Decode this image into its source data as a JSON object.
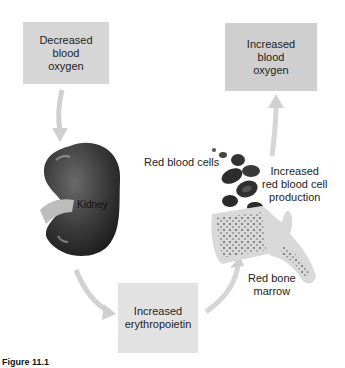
{
  "diagram": {
    "nodes": {
      "decreased_oxygen": "Decreased\nblood\noxygen",
      "increased_oxygen": "Increased\nblood\noxygen",
      "erythropoietin": "Increased\nerythropoietin"
    },
    "labels": {
      "kidney": "Kidney",
      "red_blood_cells": "Red blood cells",
      "rbc_production": "Increased\nred blood cell\nproduction",
      "red_bone_marrow": "Red bone\nmarrow"
    },
    "caption": {
      "figure_number": "Figure 11.1",
      "text": ""
    }
  }
}
